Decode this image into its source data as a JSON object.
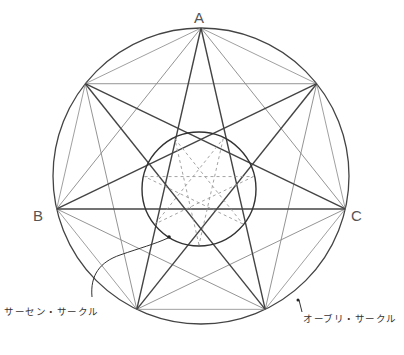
{
  "diagram": {
    "type": "geometric-construction",
    "outer_circle": {
      "cx": 201,
      "cy": 176,
      "r": 148,
      "stroke": "#444444"
    },
    "inner_circle": {
      "cx": 199,
      "cy": 189,
      "r": 57,
      "stroke": "#333333"
    },
    "star_points": 7,
    "line_color": "#444444",
    "light_line_color": "#888888",
    "dashed_color": "#999999"
  },
  "labels": {
    "vertex_a": "A",
    "vertex_b": "B",
    "vertex_c": "C",
    "inner_circle_name": "サーセン・サークル",
    "outer_circle_name": "オーブリ・サークル"
  }
}
